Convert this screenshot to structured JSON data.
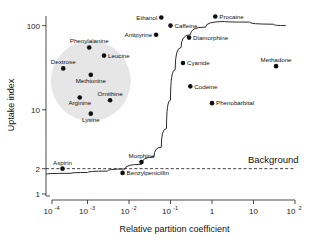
{
  "chart_data": {
    "type": "scatter",
    "title": "",
    "xlabel": "Relative partition coefficient",
    "ylabel": "Uptake index",
    "xscale": "log",
    "yscale": "log",
    "xlim": [
      0.0001,
      100
    ],
    "ylim": [
      1,
      130
    ],
    "grid": false,
    "legend": null,
    "xticks": [
      {
        "value": 0.0001,
        "label": "10",
        "exponent": "-4"
      },
      {
        "value": 0.001,
        "label": "10",
        "exponent": "-3"
      },
      {
        "value": 0.01,
        "label": "10",
        "exponent": "-2"
      },
      {
        "value": 0.1,
        "label": "10",
        "exponent": "-1"
      },
      {
        "value": 1,
        "label": "1",
        "exponent": ""
      },
      {
        "value": 10,
        "label": "10",
        "exponent": ""
      },
      {
        "value": 100,
        "label": "10",
        "exponent": "2"
      }
    ],
    "yticks": [
      {
        "value": 100,
        "label": "100"
      },
      {
        "value": 10,
        "label": "10"
      },
      {
        "value": 2,
        "label": "2"
      },
      {
        "value": 1,
        "label": "1"
      }
    ],
    "annotations": [
      {
        "name": "background-line-label",
        "text": "Background",
        "x": 30,
        "y": 2.35
      }
    ],
    "reference_lines": [
      {
        "name": "background-level",
        "style": "dashed",
        "y": 2,
        "x_start": 0.0001,
        "x_end": 100
      }
    ],
    "highlight_region": {
      "name": "amino-acid-cluster",
      "shape": "circle",
      "color": "#e6e6e6",
      "center_x": 0.0012,
      "center_y": 22,
      "members": [
        "Phenylalanine",
        "Leucine",
        "Dextrose",
        "Methionine",
        "Ornithine",
        "Arginine",
        "Lysine"
      ]
    },
    "fit_curve": {
      "name": "sigmoid-fit",
      "description": "Sigmoidal uptake curve rising from background near 10^-2 to plateau ~100",
      "points": [
        {
          "x": 0.0001,
          "y": 1.72
        },
        {
          "x": 0.0004,
          "y": 1.76
        },
        {
          "x": 0.001,
          "y": 1.8
        },
        {
          "x": 0.003,
          "y": 1.87
        },
        {
          "x": 0.008,
          "y": 1.98
        },
        {
          "x": 0.02,
          "y": 2.25
        },
        {
          "x": 0.04,
          "y": 2.75
        },
        {
          "x": 0.06,
          "y": 3.6
        },
        {
          "x": 0.08,
          "y": 6.0
        },
        {
          "x": 0.1,
          "y": 13
        },
        {
          "x": 0.13,
          "y": 30
        },
        {
          "x": 0.18,
          "y": 55
        },
        {
          "x": 0.3,
          "y": 78
        },
        {
          "x": 0.7,
          "y": 96
        },
        {
          "x": 2,
          "y": 112
        },
        {
          "x": 8,
          "y": 110
        },
        {
          "x": 30,
          "y": 104
        },
        {
          "x": 60,
          "y": 100
        }
      ]
    },
    "points": [
      {
        "label": "Ethanol",
        "x": 0.06,
        "y": 125,
        "label_pos": "left"
      },
      {
        "label": "Caffeine",
        "x": 0.1,
        "y": 100,
        "label_pos": "right"
      },
      {
        "label": "Procaine",
        "x": 1.2,
        "y": 128,
        "label_pos": "right"
      },
      {
        "label": "Antipyrine",
        "x": 0.045,
        "y": 78,
        "label_pos": "left"
      },
      {
        "label": "Diamorphine",
        "x": 0.28,
        "y": 72,
        "label_pos": "right"
      },
      {
        "label": "Phenylalanine",
        "x": 0.0011,
        "y": 55,
        "label_pos": "above"
      },
      {
        "label": "Leucine",
        "x": 0.0025,
        "y": 44,
        "label_pos": "right"
      },
      {
        "label": "Cyanide",
        "x": 0.2,
        "y": 36,
        "label_pos": "right"
      },
      {
        "label": "Methadone",
        "x": 35,
        "y": 33,
        "label_pos": "above"
      },
      {
        "label": "Dextrose",
        "x": 0.00026,
        "y": 31,
        "label_pos": "above"
      },
      {
        "label": "Methionine",
        "x": 0.0012,
        "y": 26,
        "label_pos": "below"
      },
      {
        "label": "Codeine",
        "x": 0.3,
        "y": 19,
        "label_pos": "right"
      },
      {
        "label": "Ornithine",
        "x": 0.0035,
        "y": 13,
        "label_pos": "above"
      },
      {
        "label": "Arginine",
        "x": 0.00065,
        "y": 14,
        "label_pos": "below"
      },
      {
        "label": "Phenobarbital",
        "x": 1.0,
        "y": 12,
        "label_pos": "right"
      },
      {
        "label": "Lysine",
        "x": 0.0012,
        "y": 9,
        "label_pos": "below"
      },
      {
        "label": "Morphine",
        "x": 0.02,
        "y": 2.4,
        "label_pos": "above"
      },
      {
        "label": "Aspirin",
        "x": 0.00025,
        "y": 2.0,
        "label_pos": "above"
      },
      {
        "label": "Benzylpenicillin",
        "x": 0.007,
        "y": 1.78,
        "label_pos": "right"
      }
    ]
  }
}
